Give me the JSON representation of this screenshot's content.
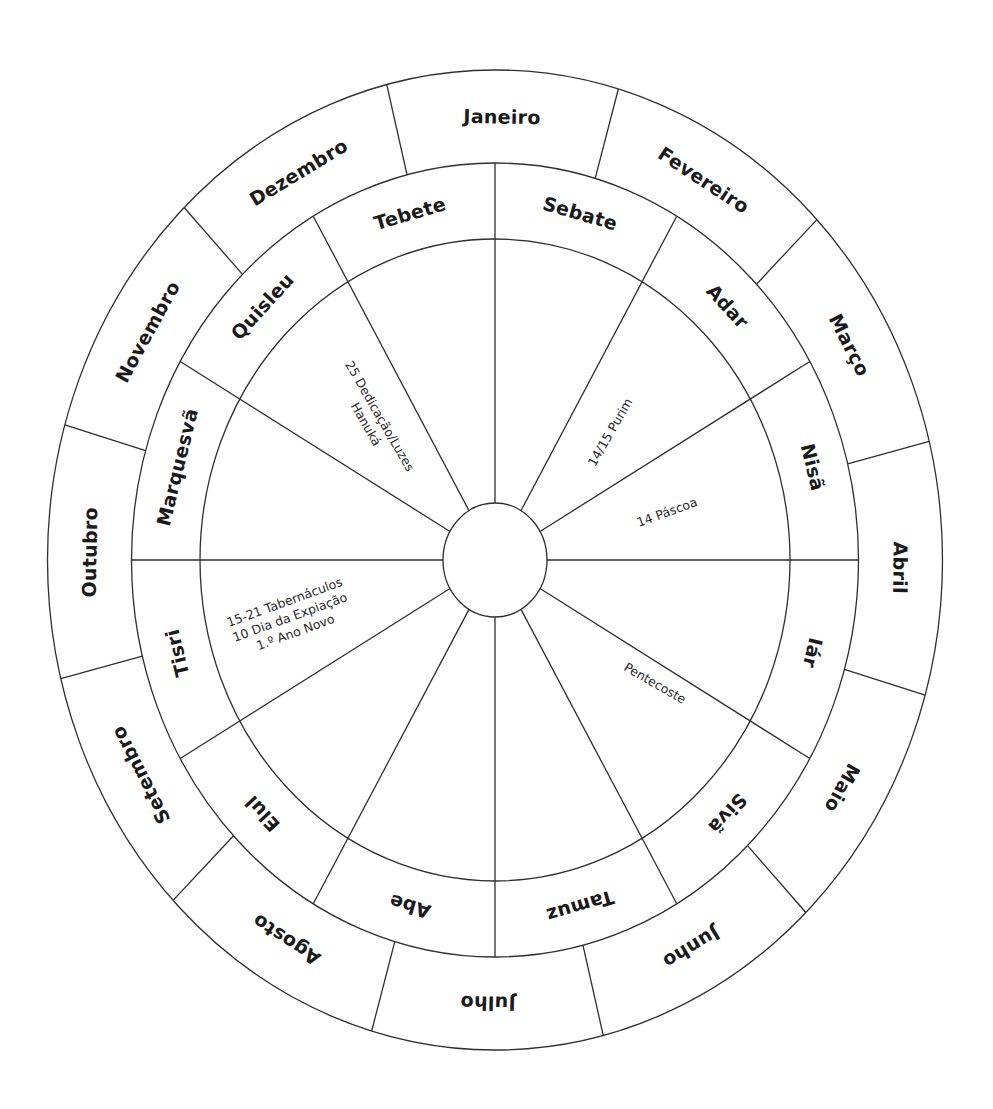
{
  "diagram": {
    "geometry": {
      "center": [
        495,
        560
      ],
      "outer_ring": [
        447.5,
        490
      ],
      "middle_ring": [
        363.5,
        397
      ],
      "inner_ring": [
        295,
        321
      ],
      "hub": [
        52,
        57
      ]
    },
    "colors": {
      "stroke": "#2f2f2f",
      "text": "#1a1a1a",
      "background": "#ffffff"
    },
    "gregorian_months": {
      "start_angle": -14,
      "span": 30,
      "labels": [
        "Janeiro",
        "Fevereiro",
        "Março",
        "Abril",
        "Maio",
        "Junho",
        "Julho",
        "Agosto",
        "Setembro",
        "Outubro",
        "Novembro",
        "Dezembro"
      ]
    },
    "hebrew_months": {
      "start_angle": 0,
      "span": 30,
      "labels": [
        "Sebate",
        "Adar",
        "Nisã",
        "Iár",
        "Sivã",
        "Tamuz",
        "Abe",
        "Elul",
        "Tisri",
        "Marquesvã",
        "Quisleu",
        "Tebete"
      ]
    },
    "events": [
      {
        "month": "Quisleu",
        "lines": [
          "25 Dedicação/Luzes",
          "Hanuká"
        ],
        "x": 373,
        "y": 420,
        "rotate": 60,
        "anchor": "middle"
      },
      {
        "month": "Adar",
        "lines": [
          "14/15 Purim"
        ],
        "x": 610,
        "y": 432,
        "rotate": -60,
        "anchor": "middle"
      },
      {
        "month": "Nisã",
        "lines": [
          "14 Páscoa"
        ],
        "x": 667,
        "y": 512,
        "rotate": -20,
        "anchor": "middle"
      },
      {
        "month": "Sivã",
        "lines": [
          "Pentecoste"
        ],
        "x": 655,
        "y": 683,
        "rotate": 30,
        "anchor": "middle"
      },
      {
        "month": "Tisri",
        "lines": [
          "15-21 Tabernáculos",
          "10 Dia da Expiação",
          "1.º Ano Novo"
        ],
        "x": 290,
        "y": 617,
        "rotate": -20,
        "anchor": "middle"
      }
    ]
  }
}
